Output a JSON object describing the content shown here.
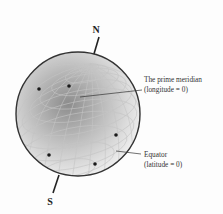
{
  "diagram": {
    "type": "globe-coordinate-diagram",
    "poles": {
      "north": "N",
      "south": "S"
    },
    "annotations": [
      {
        "id": "prime-meridian",
        "lines": [
          "The prime meridian",
          "(longitude = 0)"
        ]
      },
      {
        "id": "equator",
        "lines": [
          "Equator",
          "(latitude = 0)"
        ]
      }
    ],
    "points_count": 5,
    "colors": {
      "outline": "#333333",
      "grid": "#b8b8b8",
      "shade_dark": "#8a8a8a",
      "shade_light": "#f2f2f2",
      "point": "#1a1a1a"
    }
  }
}
